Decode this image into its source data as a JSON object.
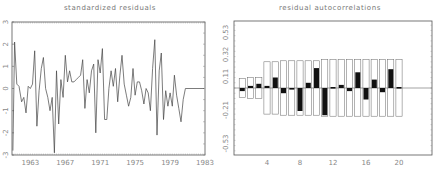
{
  "chart_data": [
    {
      "type": "line",
      "title": "standardized residuals",
      "xlabel": "",
      "ylabel": "",
      "x_tick_labels": [
        "1963",
        "1967",
        "1971",
        "1975",
        "1979",
        "1983"
      ],
      "x_ticks": [
        1963,
        1967,
        1971,
        1975,
        1979,
        1983
      ],
      "y_tick_labels": [
        "-3",
        "-2",
        "-1",
        "0",
        "1",
        "2",
        "3"
      ],
      "y_ticks": [
        -3,
        -2,
        -1,
        0,
        1,
        2,
        3
      ],
      "xlim": [
        1960.9,
        1983.0
      ],
      "ylim": [
        -3,
        3
      ],
      "grid": false,
      "series": [
        {
          "name": "standardized residuals",
          "x": [
            1961.0,
            1961.2,
            1961.45,
            1961.7,
            1962.0,
            1962.25,
            1962.5,
            1962.75,
            1963.0,
            1963.25,
            1963.5,
            1963.75,
            1964.0,
            1964.25,
            1964.5,
            1964.75,
            1965.0,
            1965.25,
            1965.5,
            1965.75,
            1966.0,
            1966.25,
            1966.5,
            1966.75,
            1967.0,
            1967.25,
            1967.5,
            1967.75,
            1968.0,
            1968.25,
            1968.5,
            1968.75,
            1969.0,
            1969.25,
            1969.5,
            1969.75,
            1970.0,
            1970.25,
            1970.5,
            1970.75,
            1971.0,
            1971.25,
            1971.5,
            1971.75,
            1972.0,
            1972.25,
            1972.5,
            1972.75,
            1973.0,
            1973.25,
            1973.5,
            1973.75,
            1974.0,
            1974.25,
            1974.5,
            1974.75,
            1975.0,
            1975.25,
            1975.5,
            1975.75,
            1976.0,
            1976.25,
            1976.5,
            1976.75,
            1977.0,
            1977.25,
            1977.5,
            1977.75,
            1978.0,
            1978.25,
            1978.5,
            1978.75,
            1979.0,
            1979.25,
            1979.5,
            1979.75,
            1980.0,
            1980.25,
            1980.5,
            1980.75,
            1981.0,
            1981.25,
            1981.5,
            1981.75,
            1982.0,
            1982.25,
            1982.5,
            1982.75,
            1983.0
          ],
          "values": [
            -2.8,
            2.1,
            0.2,
            0.1,
            -0.6,
            -0.4,
            -1.1,
            0.1,
            0.0,
            0.2,
            1.7,
            -1.7,
            -0.1,
            0.9,
            1.4,
            0.0,
            -0.4,
            -1.0,
            -0.4,
            -2.9,
            0.8,
            -1.6,
            0.4,
            -0.4,
            1.5,
            0.3,
            0.8,
            0.3,
            0.3,
            0.4,
            0.5,
            0.6,
            1.3,
            -0.9,
            0.4,
            -0.2,
            0.8,
            1.1,
            -2.0,
            1.3,
            0.7,
            1.8,
            -1.4,
            -1.4,
            0.0,
            0.8,
            0.1,
            0.9,
            -0.6,
            0.6,
            1.5,
            0.2,
            -0.3,
            -0.8,
            -0.4,
            0.9,
            -0.3,
            0.3,
            0.3,
            -0.1,
            -0.7,
            0.0,
            -0.2,
            -1.0,
            0.9,
            2.2,
            -2.1,
            0.8,
            1.6,
            -1.4,
            -0.1,
            -0.8,
            -0.2,
            -0.8,
            0.6,
            -0.3,
            -0.9,
            -1.5,
            -0.5,
            0.0,
            0.0,
            0.0,
            0.0,
            0.0,
            0.0,
            0.0,
            0.0,
            0.0,
            0.0
          ]
        }
      ]
    },
    {
      "type": "bar",
      "title": "residual autocorrelations",
      "xlabel": "",
      "ylabel": "",
      "x_tick_labels": [
        "4",
        "8",
        "12",
        "16",
        "20"
      ],
      "x_ticks": [
        4,
        8,
        12,
        16,
        20
      ],
      "y_tick_labels": [
        "-0.53",
        "-0.21",
        "0.11",
        "0.32",
        "0.53"
      ],
      "y_ticks": [
        -0.53,
        -0.21,
        0.11,
        0.32,
        0.53
      ],
      "xlim": [
        0,
        24
      ],
      "ylim": [
        -0.64,
        0.64
      ],
      "grid": false,
      "categories": [
        1,
        2,
        3,
        4,
        5,
        6,
        7,
        8,
        9,
        10,
        11,
        12,
        13,
        14,
        15,
        16,
        17,
        18,
        19,
        20
      ],
      "series": [
        {
          "name": "autocorrelation",
          "values": [
            -0.03,
            0.02,
            0.04,
            0.02,
            0.1,
            -0.05,
            -0.01,
            -0.22,
            0.05,
            0.19,
            -0.26,
            0.01,
            0.03,
            -0.03,
            0.15,
            -0.11,
            0.08,
            -0.04,
            0.18,
            0.01
          ]
        },
        {
          "name": "confidence band upper",
          "values": [
            0.09,
            0.1,
            0.1,
            0.25,
            0.25,
            0.26,
            0.26,
            0.26,
            0.26,
            0.26,
            0.27,
            0.27,
            0.27,
            0.27,
            0.27,
            0.27,
            0.27,
            0.27,
            0.27,
            0.27
          ]
        },
        {
          "name": "confidence band lower",
          "values": [
            -0.09,
            -0.1,
            -0.1,
            -0.25,
            -0.25,
            -0.26,
            -0.26,
            -0.26,
            -0.26,
            -0.26,
            -0.27,
            -0.27,
            -0.27,
            -0.27,
            -0.27,
            -0.27,
            -0.27,
            -0.27,
            -0.27,
            -0.27
          ]
        }
      ]
    }
  ]
}
